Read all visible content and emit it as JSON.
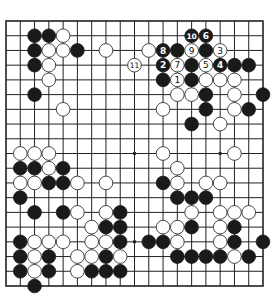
{
  "diagram": {
    "type": "go-board",
    "size": 19,
    "geometry": {
      "left": 6,
      "top": 21,
      "right": 263,
      "bottom": 286
    },
    "colors": {
      "black": "#1a1a1a",
      "white": "#ffffff",
      "line": "#222222"
    },
    "star_points": [
      [
        3,
        3
      ],
      [
        3,
        9
      ],
      [
        3,
        15
      ],
      [
        9,
        3
      ],
      [
        9,
        9
      ],
      [
        9,
        15
      ],
      [
        15,
        3
      ],
      [
        15,
        9
      ],
      [
        15,
        15
      ]
    ],
    "stones": [
      {
        "r": 1,
        "c": 2,
        "color": "B"
      },
      {
        "r": 1,
        "c": 3,
        "color": "B"
      },
      {
        "r": 1,
        "c": 4,
        "color": "W"
      },
      {
        "r": 1,
        "c": 13,
        "color": "B",
        "label": "10"
      },
      {
        "r": 1,
        "c": 14,
        "color": "B",
        "label": "6"
      },
      {
        "r": 2,
        "c": 2,
        "color": "B"
      },
      {
        "r": 2,
        "c": 3,
        "color": "W"
      },
      {
        "r": 2,
        "c": 4,
        "color": "W"
      },
      {
        "r": 2,
        "c": 5,
        "color": "B"
      },
      {
        "r": 2,
        "c": 7,
        "color": "W"
      },
      {
        "r": 2,
        "c": 10,
        "color": "W"
      },
      {
        "r": 2,
        "c": 11,
        "color": "B",
        "label": "8"
      },
      {
        "r": 2,
        "c": 12,
        "color": "B"
      },
      {
        "r": 2,
        "c": 13,
        "color": "W",
        "label": "9"
      },
      {
        "r": 2,
        "c": 14,
        "color": "B"
      },
      {
        "r": 2,
        "c": 15,
        "color": "W",
        "label": "3"
      },
      {
        "r": 3,
        "c": 2,
        "color": "B"
      },
      {
        "r": 3,
        "c": 3,
        "color": "W"
      },
      {
        "r": 3,
        "c": 9,
        "color": "W",
        "label": "11"
      },
      {
        "r": 3,
        "c": 11,
        "color": "B",
        "label": "2"
      },
      {
        "r": 3,
        "c": 12,
        "color": "W",
        "label": "7"
      },
      {
        "r": 3,
        "c": 13,
        "color": "B"
      },
      {
        "r": 3,
        "c": 14,
        "color": "W",
        "label": "5"
      },
      {
        "r": 3,
        "c": 15,
        "color": "B",
        "label": "4"
      },
      {
        "r": 3,
        "c": 16,
        "color": "B"
      },
      {
        "r": 3,
        "c": 17,
        "color": "B"
      },
      {
        "r": 4,
        "c": 3,
        "color": "W"
      },
      {
        "r": 4,
        "c": 11,
        "color": "B"
      },
      {
        "r": 4,
        "c": 12,
        "color": "W",
        "label": "1"
      },
      {
        "r": 4,
        "c": 13,
        "color": "B"
      },
      {
        "r": 4,
        "c": 14,
        "color": "W"
      },
      {
        "r": 4,
        "c": 15,
        "color": "W"
      },
      {
        "r": 4,
        "c": 16,
        "color": "W"
      },
      {
        "r": 5,
        "c": 2,
        "color": "B"
      },
      {
        "r": 5,
        "c": 12,
        "color": "W"
      },
      {
        "r": 5,
        "c": 13,
        "color": "W"
      },
      {
        "r": 5,
        "c": 14,
        "color": "B"
      },
      {
        "r": 5,
        "c": 16,
        "color": "W"
      },
      {
        "r": 5,
        "c": 18,
        "color": "B"
      },
      {
        "r": 6,
        "c": 4,
        "color": "W"
      },
      {
        "r": 6,
        "c": 11,
        "color": "W"
      },
      {
        "r": 6,
        "c": 14,
        "color": "B"
      },
      {
        "r": 6,
        "c": 16,
        "color": "W"
      },
      {
        "r": 6,
        "c": 17,
        "color": "B"
      },
      {
        "r": 7,
        "c": 13,
        "color": "B"
      },
      {
        "r": 7,
        "c": 15,
        "color": "W"
      },
      {
        "r": 9,
        "c": 1,
        "color": "W"
      },
      {
        "r": 9,
        "c": 2,
        "color": "W"
      },
      {
        "r": 9,
        "c": 3,
        "color": "W"
      },
      {
        "r": 9,
        "c": 11,
        "color": "W"
      },
      {
        "r": 9,
        "c": 16,
        "color": "W"
      },
      {
        "r": 10,
        "c": 1,
        "color": "B"
      },
      {
        "r": 10,
        "c": 2,
        "color": "B"
      },
      {
        "r": 10,
        "c": 3,
        "color": "W"
      },
      {
        "r": 10,
        "c": 4,
        "color": "B"
      },
      {
        "r": 10,
        "c": 12,
        "color": "W"
      },
      {
        "r": 11,
        "c": 1,
        "color": "W"
      },
      {
        "r": 11,
        "c": 2,
        "color": "W"
      },
      {
        "r": 11,
        "c": 3,
        "color": "B"
      },
      {
        "r": 11,
        "c": 4,
        "color": "B"
      },
      {
        "r": 11,
        "c": 5,
        "color": "W"
      },
      {
        "r": 11,
        "c": 7,
        "color": "W"
      },
      {
        "r": 11,
        "c": 11,
        "color": "B"
      },
      {
        "r": 11,
        "c": 12,
        "color": "W"
      },
      {
        "r": 11,
        "c": 14,
        "color": "W"
      },
      {
        "r": 11,
        "c": 15,
        "color": "W"
      },
      {
        "r": 12,
        "c": 1,
        "color": "B"
      },
      {
        "r": 12,
        "c": 12,
        "color": "B"
      },
      {
        "r": 12,
        "c": 13,
        "color": "B"
      },
      {
        "r": 12,
        "c": 14,
        "color": "B"
      },
      {
        "r": 13,
        "c": 2,
        "color": "B"
      },
      {
        "r": 13,
        "c": 4,
        "color": "B"
      },
      {
        "r": 13,
        "c": 5,
        "color": "W"
      },
      {
        "r": 13,
        "c": 7,
        "color": "W"
      },
      {
        "r": 13,
        "c": 8,
        "color": "B"
      },
      {
        "r": 13,
        "c": 13,
        "color": "W"
      },
      {
        "r": 13,
        "c": 15,
        "color": "W"
      },
      {
        "r": 13,
        "c": 16,
        "color": "W"
      },
      {
        "r": 13,
        "c": 17,
        "color": "W"
      },
      {
        "r": 14,
        "c": 6,
        "color": "W"
      },
      {
        "r": 14,
        "c": 7,
        "color": "B"
      },
      {
        "r": 14,
        "c": 8,
        "color": "B"
      },
      {
        "r": 14,
        "c": 11,
        "color": "W"
      },
      {
        "r": 14,
        "c": 12,
        "color": "W"
      },
      {
        "r": 14,
        "c": 13,
        "color": "B"
      },
      {
        "r": 14,
        "c": 15,
        "color": "W"
      },
      {
        "r": 14,
        "c": 16,
        "color": "B"
      },
      {
        "r": 15,
        "c": 1,
        "color": "B"
      },
      {
        "r": 15,
        "c": 2,
        "color": "W"
      },
      {
        "r": 15,
        "c": 3,
        "color": "W"
      },
      {
        "r": 15,
        "c": 4,
        "color": "W"
      },
      {
        "r": 15,
        "c": 6,
        "color": "W"
      },
      {
        "r": 15,
        "c": 7,
        "color": "W"
      },
      {
        "r": 15,
        "c": 8,
        "color": "B"
      },
      {
        "r": 15,
        "c": 10,
        "color": "B"
      },
      {
        "r": 15,
        "c": 11,
        "color": "B"
      },
      {
        "r": 15,
        "c": 12,
        "color": "W"
      },
      {
        "r": 15,
        "c": 15,
        "color": "W"
      },
      {
        "r": 15,
        "c": 16,
        "color": "B"
      },
      {
        "r": 15,
        "c": 18,
        "color": "B"
      },
      {
        "r": 16,
        "c": 1,
        "color": "B"
      },
      {
        "r": 16,
        "c": 2,
        "color": "W"
      },
      {
        "r": 16,
        "c": 3,
        "color": "B"
      },
      {
        "r": 16,
        "c": 5,
        "color": "W"
      },
      {
        "r": 16,
        "c": 6,
        "color": "W"
      },
      {
        "r": 16,
        "c": 7,
        "color": "B"
      },
      {
        "r": 16,
        "c": 8,
        "color": "W"
      },
      {
        "r": 16,
        "c": 12,
        "color": "B"
      },
      {
        "r": 16,
        "c": 13,
        "color": "B"
      },
      {
        "r": 16,
        "c": 14,
        "color": "B"
      },
      {
        "r": 16,
        "c": 15,
        "color": "B"
      },
      {
        "r": 16,
        "c": 16,
        "color": "W"
      },
      {
        "r": 16,
        "c": 17,
        "color": "B"
      },
      {
        "r": 17,
        "c": 1,
        "color": "B"
      },
      {
        "r": 17,
        "c": 2,
        "color": "W"
      },
      {
        "r": 17,
        "c": 3,
        "color": "B"
      },
      {
        "r": 17,
        "c": 5,
        "color": "W"
      },
      {
        "r": 17,
        "c": 6,
        "color": "B"
      },
      {
        "r": 17,
        "c": 7,
        "color": "B"
      },
      {
        "r": 17,
        "c": 8,
        "color": "B"
      },
      {
        "r": 18,
        "c": 2,
        "color": "B"
      }
    ]
  }
}
